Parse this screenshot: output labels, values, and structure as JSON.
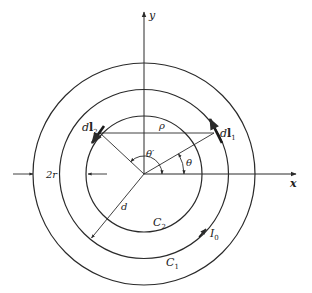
{
  "figure": {
    "center": [
      144,
      174
    ],
    "colors": {
      "stroke": "#2a2a2a",
      "background": "#ffffff"
    },
    "axes": {
      "x_label": "x",
      "y_label": "y"
    },
    "circles": [
      {
        "name": "outer-edge",
        "radius": 111,
        "label": ""
      },
      {
        "name": "C1",
        "radius": 84.5,
        "label_main": "C",
        "label_sub": "1"
      },
      {
        "name": "C2",
        "radius": 58,
        "label_main": "C",
        "label_sub": "2"
      }
    ],
    "labels": {
      "dl1_main": "d",
      "dl1_bold": "l",
      "dl1_sub": "1",
      "dl2_main": "d",
      "dl2_bold": "l",
      "dl2_sub": "2",
      "rho": "ρ",
      "theta": "θ",
      "theta_prime": "θ′",
      "d": "d",
      "two_r": "2r",
      "current_main": "I",
      "current_sub": "0"
    }
  }
}
